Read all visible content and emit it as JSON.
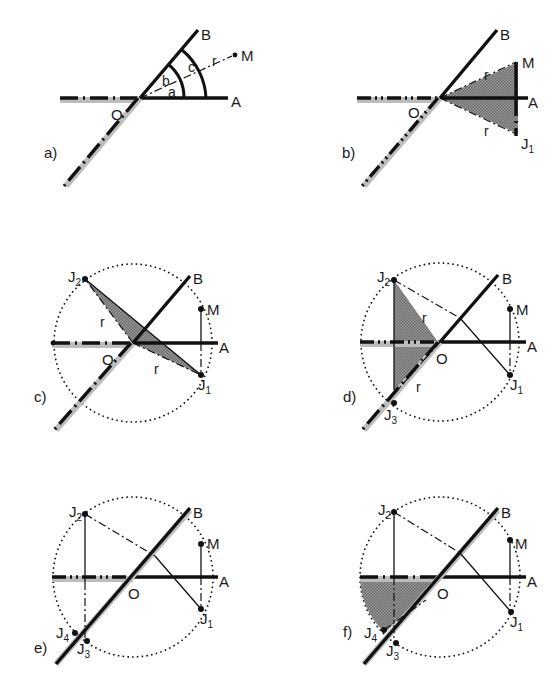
{
  "figure": {
    "panels": [
      {
        "id": "a",
        "label": "a)",
        "points": [
          "B",
          "M",
          "A",
          "O"
        ],
        "angle_labels": [
          "a",
          "b",
          "c"
        ],
        "radius_label": "r"
      },
      {
        "id": "b",
        "label": "b)",
        "points": [
          "B",
          "M",
          "A",
          "O",
          "J1"
        ],
        "radius_labels": [
          "r",
          "r"
        ]
      },
      {
        "id": "c",
        "label": "c)",
        "points": [
          "J2",
          "B",
          "M",
          "A",
          "O",
          "J1"
        ],
        "radius_labels": [
          "r",
          "r"
        ]
      },
      {
        "id": "d",
        "label": "d)",
        "points": [
          "J2",
          "B",
          "M",
          "A",
          "O",
          "J1",
          "J3"
        ],
        "radius_labels": [
          "r",
          "r"
        ]
      },
      {
        "id": "e",
        "label": "e)",
        "points": [
          "J2",
          "B",
          "M",
          "A",
          "O",
          "J1",
          "J4",
          "J3"
        ]
      },
      {
        "id": "f",
        "label": "f)",
        "points": [
          "J2",
          "B",
          "M",
          "A",
          "O",
          "J1",
          "J4",
          "J3"
        ]
      }
    ],
    "labels": {
      "A": "A",
      "B": "B",
      "M": "M",
      "O": "O",
      "r": "r",
      "a": "a",
      "b": "b",
      "c": "c",
      "J": "J",
      "one": "1",
      "two": "2",
      "three": "3",
      "four": "4"
    }
  }
}
